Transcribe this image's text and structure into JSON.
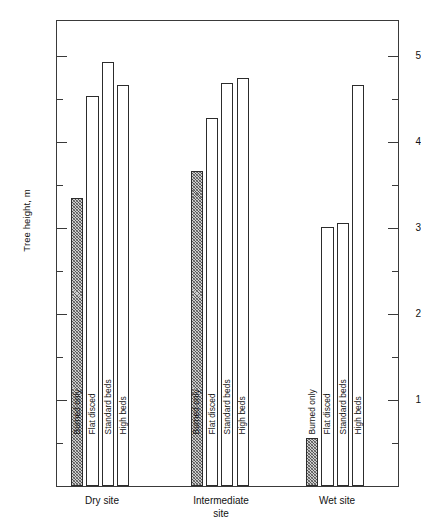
{
  "chart_data": {
    "type": "bar",
    "title": "",
    "xlabel": "",
    "ylabel": "Tree height, m",
    "ylim": [
      0,
      5.43
    ],
    "grid": false,
    "legend_position": "in-bar rotated labels",
    "categories": [
      "Dry site",
      "Intermediate site",
      "Wet site"
    ],
    "category_labels_display": [
      "Dry site",
      "Intermediate\nsite",
      "Wet site"
    ],
    "treatments": [
      "Burned only",
      "Flat disced",
      "Standard beds",
      "High beds"
    ],
    "series": [
      {
        "name": "Burned only",
        "values": [
          3.35,
          3.67,
          0.56
        ]
      },
      {
        "name": "Flat disced",
        "values": [
          4.54,
          4.28,
          3.02
        ]
      },
      {
        "name": "Standard beds",
        "values": [
          4.93,
          4.69,
          3.06
        ]
      },
      {
        "name": "High beds",
        "values": [
          4.67,
          4.75,
          4.67
        ]
      }
    ],
    "y_major_ticks": [
      1,
      2,
      3,
      4,
      5
    ],
    "y_major_tick_labels": [
      "1",
      "2",
      "3",
      "4",
      "5"
    ],
    "y_minor_ticks": [
      0.5,
      1.5,
      2.5,
      3.5,
      4.5
    ],
    "colors": {
      "axis": "#3a3a3a",
      "bar_outline": "#2c2c2c",
      "bar_fill_open": "#ffffff",
      "bar_fill_hatched": "#cfcfcf",
      "text": "#111111",
      "background": "#ffffff"
    }
  }
}
